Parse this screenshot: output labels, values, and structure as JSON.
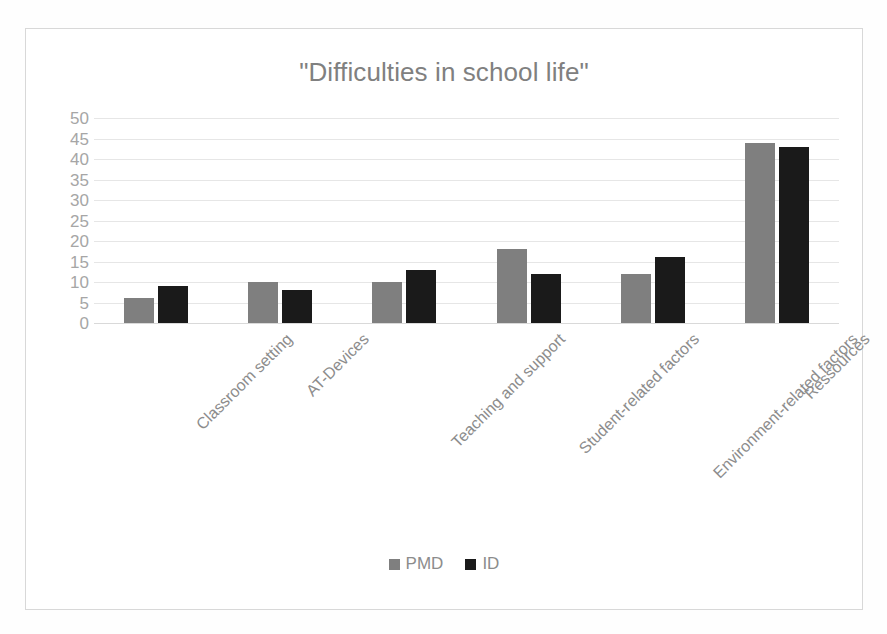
{
  "chart_data": {
    "type": "bar",
    "title": "\"Difficulties in school life\"",
    "xlabel": "",
    "ylabel": "",
    "ylim": [
      0,
      50
    ],
    "ytick_step": 5,
    "yticks": [
      50,
      45,
      40,
      35,
      30,
      25,
      20,
      15,
      10,
      5,
      0
    ],
    "grid": true,
    "legend_position": "bottom",
    "categories": [
      "Classroom setting",
      "AT-Devices",
      "Teaching and support",
      "Student-related factors",
      "Environment-related factors",
      "Ressources"
    ],
    "series": [
      {
        "name": "PMD",
        "color": "#7f7f7f",
        "values": [
          6,
          10,
          10,
          18,
          12,
          44
        ]
      },
      {
        "name": "ID",
        "color": "#1a1a1a",
        "values": [
          9,
          8,
          13,
          12,
          16,
          43
        ]
      }
    ]
  },
  "legend": {
    "items": [
      {
        "label": "PMD",
        "color": "#7f7f7f"
      },
      {
        "label": "ID",
        "color": "#1a1a1a"
      }
    ]
  },
  "colors": {
    "title": "#808080",
    "tick_label": "#a6a6a6",
    "category_label": "#8c8c8c",
    "gridline": "#e6e6e6",
    "frame_border": "#d8d8d8",
    "background": "#ffffff"
  }
}
